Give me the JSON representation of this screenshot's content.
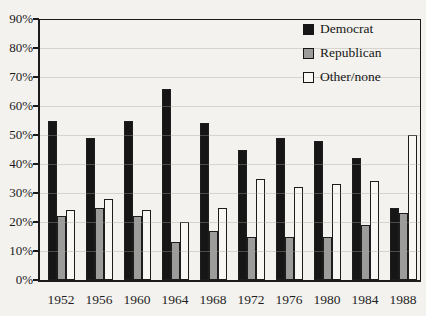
{
  "figure": {
    "background_color": "#f3f2ee",
    "ink_color": "#1b1b1b",
    "grid_color": "#a8a298"
  },
  "chart_data": {
    "type": "bar",
    "title": "",
    "xlabel": "",
    "ylabel": "",
    "categories": [
      "1952",
      "1956",
      "1960",
      "1964",
      "1968",
      "1972",
      "1976",
      "1980",
      "1984",
      "1988"
    ],
    "series": [
      {
        "name": "Democrat",
        "color": "#161616",
        "values": [
          55,
          49,
          55,
          66,
          54,
          45,
          49,
          48,
          42,
          25
        ]
      },
      {
        "name": "Republican",
        "color": "#9c9c9a",
        "values": [
          22,
          25,
          22,
          13,
          17,
          15,
          15,
          15,
          19,
          23
        ]
      },
      {
        "name": "Other/none",
        "color": "#f8f7f4",
        "values": [
          24,
          28,
          24,
          20,
          25,
          35,
          32,
          33,
          34,
          50
        ]
      }
    ],
    "y_axis": {
      "min": 0,
      "max": 90,
      "step": 10,
      "tick_labels": [
        "0%",
        "10%",
        "20%",
        "30%",
        "40%",
        "50%",
        "60%",
        "70%",
        "80%",
        "90%"
      ]
    },
    "x_axis": {
      "tick_labels": [
        "1952",
        "1956",
        "1960",
        "1964",
        "1968",
        "1972",
        "1976",
        "1980",
        "1984",
        "1988"
      ]
    },
    "legend": {
      "position": "top-right-inside",
      "entries": [
        "Democrat",
        "Republican",
        "Other/none"
      ]
    },
    "grid": {
      "horizontal": true,
      "faint": true
    },
    "bar_outline_color": "#1d1d1d"
  }
}
